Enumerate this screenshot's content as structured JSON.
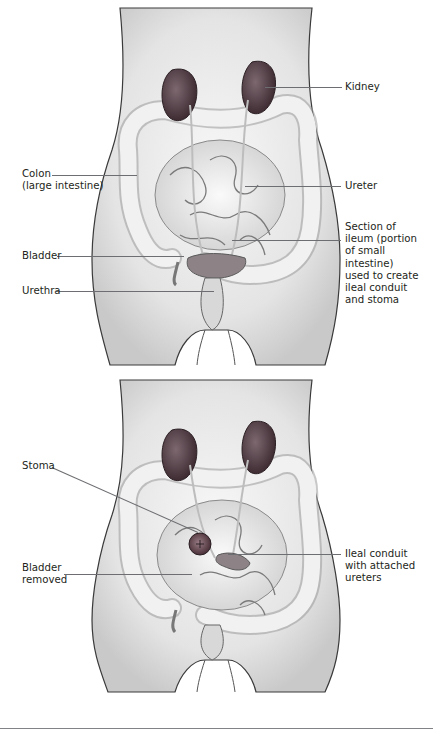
{
  "figure": {
    "panels": [
      {
        "id": "before",
        "description": "Anatomy before surgery",
        "labels": [
          {
            "key": "kidney",
            "text": "Kidney"
          },
          {
            "key": "colon",
            "text": "Colon\n(large intestine)"
          },
          {
            "key": "ureter",
            "text": "Ureter"
          },
          {
            "key": "ileum_section",
            "text": "Section of\nileum (portion\nof small\nintestine)\nused to create\nileal conduit\nand stoma"
          },
          {
            "key": "bladder",
            "text": "Bladder"
          },
          {
            "key": "urethra",
            "text": "Urethra"
          }
        ]
      },
      {
        "id": "after",
        "description": "Anatomy after ileal conduit surgery",
        "labels": [
          {
            "key": "stoma",
            "text": "Stoma"
          },
          {
            "key": "ileal_conduit",
            "text": "Ileal conduit\nwith attached\nureters"
          },
          {
            "key": "bladder_removed",
            "text": "Bladder\nremoved"
          }
        ]
      }
    ],
    "colors": {
      "skin_outline": "#3a3a3a",
      "skin_shade": "#d9d9d9",
      "organ_dark": "#5a4048",
      "intestine": "#ececec",
      "leader_line": "#6d6e71",
      "text": "#231f20"
    }
  }
}
